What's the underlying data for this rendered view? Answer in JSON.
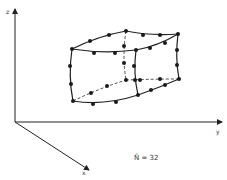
{
  "diagram": {
    "type": "3d-finite-element",
    "axes": {
      "z_label": "z",
      "y_label": "y",
      "x_label": "x"
    },
    "annotation": "N̄ = 32",
    "node_count": 32,
    "colors": {
      "line": "#222222",
      "node": "#1a1a1a",
      "background": "#ffffff"
    }
  }
}
